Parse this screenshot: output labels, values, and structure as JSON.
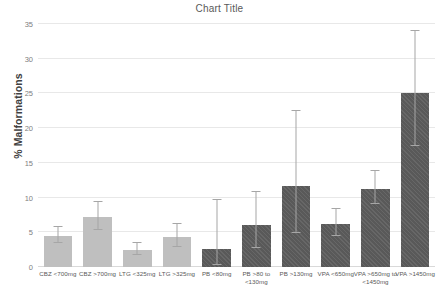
{
  "chart_data": {
    "type": "bar",
    "title": "Chart Title",
    "xlabel": "",
    "ylabel": "% Malformations",
    "ylim": [
      0,
      35
    ],
    "ytick_step": 5,
    "yticks": [
      0,
      5,
      10,
      15,
      20,
      25,
      30,
      35
    ],
    "grid": true,
    "legend": null,
    "categories": [
      "CBZ <700mg",
      "CBZ >700mg",
      "LTG <325mg",
      "LTG >325mg",
      "PB <80mg",
      "PB >80 to <130mg",
      "PB >130mg",
      "VPA <650mg",
      "VPA >650mg to <1450mg",
      "VPA >1450mg"
    ],
    "values": [
      4.4,
      7.2,
      2.5,
      4.3,
      2.6,
      6.1,
      11.6,
      6.2,
      11.2,
      25.0
    ],
    "error_upper": [
      5.8,
      9.4,
      3.5,
      6.2,
      9.6,
      10.8,
      22.4,
      8.4,
      13.8,
      34.0
    ],
    "error_lower": [
      3.4,
      5.4,
      1.7,
      2.9,
      0.3,
      2.8,
      4.9,
      4.4,
      9.1,
      17.4
    ],
    "bar_styles": [
      "light",
      "light",
      "light",
      "light",
      "dark",
      "dark",
      "dark",
      "dark",
      "dark",
      "dark"
    ],
    "colors": {
      "light_bar": "#bfbfbf",
      "dark_bar": "#595959",
      "error_bar": "#a6a6a6",
      "gridline": "#e8e8e8",
      "title_text": "#595959",
      "axis_text": "#808080",
      "axis_title_text": "#404040"
    }
  }
}
